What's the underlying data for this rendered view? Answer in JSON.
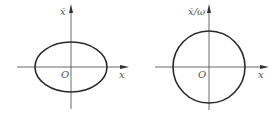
{
  "panels": [
    {
      "id": "left",
      "y_label": "ẋ",
      "x_label": "x",
      "origin_label": "O",
      "curve": "ellipse"
    },
    {
      "id": "right",
      "y_label": "ẋ/ω",
      "x_label": "x",
      "origin_label": "O",
      "curve": "circle"
    }
  ],
  "colors": {
    "curve": "#2a2a2a",
    "axis": "#444444",
    "label": "#555555"
  }
}
